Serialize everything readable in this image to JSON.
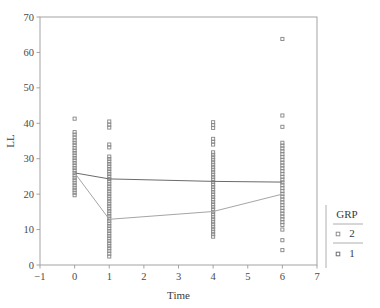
{
  "chart_data": {
    "type": "scatter",
    "title": "",
    "xlabel": "Time",
    "ylabel": "LL",
    "xlim": [
      -1,
      7
    ],
    "ylim": [
      0,
      70
    ],
    "xticks": [
      -1,
      0,
      1,
      2,
      3,
      4,
      5,
      6,
      7
    ],
    "xtick_labels": [
      "−1",
      "0",
      "1",
      "2",
      "3",
      "4",
      "5",
      "6",
      "7"
    ],
    "yticks": [
      0,
      10,
      20,
      30,
      40,
      50,
      60,
      70
    ],
    "ytick_labels": [
      "0",
      "10",
      "20",
      "30",
      "40",
      "50",
      "60",
      "70"
    ],
    "grid": false,
    "legend": {
      "title": "GRP",
      "position": "right",
      "entries": [
        {
          "label": "2",
          "marker": "open-square",
          "color": "#8a8a8a"
        },
        {
          "label": "1",
          "marker": "open-square",
          "color": "#6a6a6a"
        }
      ]
    },
    "marker": "open-square",
    "marker_color": "#7a7a7a",
    "series": [
      {
        "name": "GRP 2",
        "marker": "open-square",
        "color": "#8a8a8a",
        "points": [
          {
            "x": 0,
            "y": 41.3
          },
          {
            "x": 0,
            "y": 37.5
          },
          {
            "x": 0,
            "y": 36.8
          },
          {
            "x": 0,
            "y": 36.0
          },
          {
            "x": 0,
            "y": 35.2
          },
          {
            "x": 0,
            "y": 34.5
          },
          {
            "x": 0,
            "y": 33.8
          },
          {
            "x": 0,
            "y": 33.0
          },
          {
            "x": 0,
            "y": 32.3
          },
          {
            "x": 0,
            "y": 31.6
          },
          {
            "x": 0,
            "y": 30.9
          },
          {
            "x": 0,
            "y": 30.2
          },
          {
            "x": 0,
            "y": 29.5
          },
          {
            "x": 0,
            "y": 28.8
          },
          {
            "x": 0,
            "y": 28.1
          },
          {
            "x": 0,
            "y": 27.4
          },
          {
            "x": 0,
            "y": 26.7
          },
          {
            "x": 0,
            "y": 26.0
          },
          {
            "x": 0,
            "y": 25.3
          },
          {
            "x": 0,
            "y": 24.6
          },
          {
            "x": 0,
            "y": 23.9
          },
          {
            "x": 0,
            "y": 23.2
          },
          {
            "x": 0,
            "y": 22.5
          },
          {
            "x": 0,
            "y": 21.8
          },
          {
            "x": 0,
            "y": 21.1
          },
          {
            "x": 0,
            "y": 20.4
          },
          {
            "x": 0,
            "y": 19.7
          },
          {
            "x": 1,
            "y": 40.5
          },
          {
            "x": 1,
            "y": 39.6
          },
          {
            "x": 1,
            "y": 38.8
          },
          {
            "x": 1,
            "y": 34.0
          },
          {
            "x": 1,
            "y": 33.2
          },
          {
            "x": 1,
            "y": 30.6
          },
          {
            "x": 1,
            "y": 29.9
          },
          {
            "x": 1,
            "y": 29.2
          },
          {
            "x": 1,
            "y": 28.5
          },
          {
            "x": 1,
            "y": 27.8
          },
          {
            "x": 1,
            "y": 27.1
          },
          {
            "x": 1,
            "y": 26.4
          },
          {
            "x": 1,
            "y": 25.7
          },
          {
            "x": 1,
            "y": 25.0
          },
          {
            "x": 1,
            "y": 24.3
          },
          {
            "x": 1,
            "y": 23.6
          },
          {
            "x": 1,
            "y": 22.9
          },
          {
            "x": 1,
            "y": 22.2
          },
          {
            "x": 1,
            "y": 21.5
          },
          {
            "x": 1,
            "y": 20.8
          },
          {
            "x": 1,
            "y": 20.1
          },
          {
            "x": 1,
            "y": 19.4
          },
          {
            "x": 1,
            "y": 18.7
          },
          {
            "x": 1,
            "y": 18.0
          },
          {
            "x": 1,
            "y": 17.3
          },
          {
            "x": 1,
            "y": 16.6
          },
          {
            "x": 1,
            "y": 15.9
          },
          {
            "x": 1,
            "y": 15.2
          },
          {
            "x": 1,
            "y": 14.5
          },
          {
            "x": 1,
            "y": 13.8
          },
          {
            "x": 1,
            "y": 13.1
          },
          {
            "x": 1,
            "y": 12.4
          },
          {
            "x": 1,
            "y": 11.7
          },
          {
            "x": 1,
            "y": 11.0
          },
          {
            "x": 1,
            "y": 10.3
          },
          {
            "x": 1,
            "y": 9.6
          },
          {
            "x": 1,
            "y": 8.9
          },
          {
            "x": 1,
            "y": 8.2
          },
          {
            "x": 1,
            "y": 7.5
          },
          {
            "x": 1,
            "y": 6.8
          },
          {
            "x": 1,
            "y": 6.1
          },
          {
            "x": 1,
            "y": 5.4
          },
          {
            "x": 1,
            "y": 4.7
          },
          {
            "x": 1,
            "y": 4.0
          },
          {
            "x": 1,
            "y": 3.2
          },
          {
            "x": 1,
            "y": 2.4
          },
          {
            "x": 4,
            "y": 40.3
          },
          {
            "x": 4,
            "y": 39.5
          },
          {
            "x": 4,
            "y": 38.7
          },
          {
            "x": 4,
            "y": 35.6
          },
          {
            "x": 4,
            "y": 34.8
          },
          {
            "x": 4,
            "y": 34.0
          },
          {
            "x": 4,
            "y": 31.8
          },
          {
            "x": 4,
            "y": 31.1
          },
          {
            "x": 4,
            "y": 30.4
          },
          {
            "x": 4,
            "y": 29.7
          },
          {
            "x": 4,
            "y": 29.0
          },
          {
            "x": 4,
            "y": 28.3
          },
          {
            "x": 4,
            "y": 27.6
          },
          {
            "x": 4,
            "y": 26.9
          },
          {
            "x": 4,
            "y": 26.2
          },
          {
            "x": 4,
            "y": 25.5
          },
          {
            "x": 4,
            "y": 24.8
          },
          {
            "x": 4,
            "y": 24.1
          },
          {
            "x": 4,
            "y": 23.4
          },
          {
            "x": 4,
            "y": 22.7
          },
          {
            "x": 4,
            "y": 22.0
          },
          {
            "x": 4,
            "y": 21.3
          },
          {
            "x": 4,
            "y": 20.6
          },
          {
            "x": 4,
            "y": 19.9
          },
          {
            "x": 4,
            "y": 19.2
          },
          {
            "x": 4,
            "y": 18.5
          },
          {
            "x": 4,
            "y": 17.8
          },
          {
            "x": 4,
            "y": 17.1
          },
          {
            "x": 4,
            "y": 16.4
          },
          {
            "x": 4,
            "y": 15.7
          },
          {
            "x": 4,
            "y": 15.0
          },
          {
            "x": 4,
            "y": 14.3
          },
          {
            "x": 4,
            "y": 13.6
          },
          {
            "x": 4,
            "y": 12.9
          },
          {
            "x": 4,
            "y": 12.2
          },
          {
            "x": 4,
            "y": 11.5
          },
          {
            "x": 4,
            "y": 10.8
          },
          {
            "x": 4,
            "y": 10.1
          },
          {
            "x": 4,
            "y": 9.4
          },
          {
            "x": 4,
            "y": 8.7
          },
          {
            "x": 4,
            "y": 8.0
          },
          {
            "x": 6,
            "y": 63.8
          },
          {
            "x": 6,
            "y": 42.2
          },
          {
            "x": 6,
            "y": 39.0
          },
          {
            "x": 6,
            "y": 34.5
          },
          {
            "x": 6,
            "y": 33.7
          },
          {
            "x": 6,
            "y": 32.9
          },
          {
            "x": 6,
            "y": 32.1
          },
          {
            "x": 6,
            "y": 31.3
          },
          {
            "x": 6,
            "y": 30.5
          },
          {
            "x": 6,
            "y": 29.7
          },
          {
            "x": 6,
            "y": 28.9
          },
          {
            "x": 6,
            "y": 28.1
          },
          {
            "x": 6,
            "y": 27.3
          },
          {
            "x": 6,
            "y": 26.5
          },
          {
            "x": 6,
            "y": 25.7
          },
          {
            "x": 6,
            "y": 24.9
          },
          {
            "x": 6,
            "y": 24.1
          },
          {
            "x": 6,
            "y": 23.3
          },
          {
            "x": 6,
            "y": 22.5
          },
          {
            "x": 6,
            "y": 21.7
          },
          {
            "x": 6,
            "y": 20.9
          },
          {
            "x": 6,
            "y": 20.1
          },
          {
            "x": 6,
            "y": 19.3
          },
          {
            "x": 6,
            "y": 18.5
          },
          {
            "x": 6,
            "y": 17.7
          },
          {
            "x": 6,
            "y": 16.9
          },
          {
            "x": 6,
            "y": 16.1
          },
          {
            "x": 6,
            "y": 15.3
          },
          {
            "x": 6,
            "y": 14.5
          },
          {
            "x": 6,
            "y": 13.7
          },
          {
            "x": 6,
            "y": 12.9
          },
          {
            "x": 6,
            "y": 12.1
          },
          {
            "x": 6,
            "y": 11.3
          },
          {
            "x": 6,
            "y": 10.0
          },
          {
            "x": 6,
            "y": 7.0
          },
          {
            "x": 6,
            "y": 4.2
          }
        ]
      }
    ],
    "trend_lines": [
      {
        "name": "GRP 2 mean",
        "color": "#6b6b6b",
        "width": 1.0,
        "points": [
          {
            "x": 0,
            "y": 26.0
          },
          {
            "x": 1,
            "y": 24.3
          },
          {
            "x": 4,
            "y": 23.6
          },
          {
            "x": 6,
            "y": 23.4
          }
        ]
      },
      {
        "name": "GRP 1 mean",
        "color": "#a5a5a5",
        "width": 1.0,
        "points": [
          {
            "x": 0,
            "y": 26.0
          },
          {
            "x": 1,
            "y": 12.9
          },
          {
            "x": 4,
            "y": 15.1
          },
          {
            "x": 6,
            "y": 20.0
          }
        ]
      }
    ]
  }
}
